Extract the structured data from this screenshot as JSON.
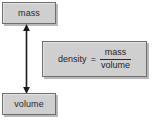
{
  "diagram": {
    "background_color": "#ffffff",
    "box_fill_color": "#cfcfcf",
    "box_border_color": "#6e6e6e",
    "box_shadow_color": "#b9b9b9",
    "text_color": "#1f1f1f",
    "nodes": [
      {
        "id": "mass",
        "label": "mass"
      },
      {
        "id": "volume",
        "label": "volume"
      }
    ],
    "connector": {
      "name": "double-headed-vertical-arrow",
      "from": "mass",
      "to": "volume",
      "style": "double-headed",
      "color": "#1a1a1a"
    },
    "formula": {
      "lhs": "density",
      "operator": "=",
      "numerator": "mass",
      "denominator": "volume"
    }
  }
}
